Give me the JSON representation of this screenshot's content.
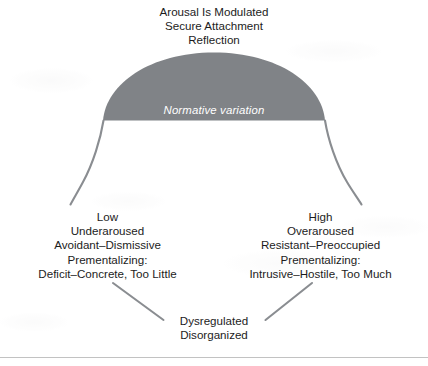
{
  "figure": {
    "title_block": {
      "lines": [
        "Arousal Is Modulated",
        "Secure Attachment",
        "Reflection"
      ]
    },
    "arch": {
      "caption": "Normative variation",
      "fill_color": "#808387",
      "stroke_color": "#8a8d91",
      "caption_color": "#ffffff"
    },
    "left_branch": {
      "lines": [
        "Low",
        "Underaroused",
        "Avoidant–Dismissive",
        "Prementalizing:",
        "Deficit–Concrete, Too Little"
      ]
    },
    "right_branch": {
      "lines": [
        "High",
        "Overaroused",
        "Resistant–Preoccupied",
        "Prementalizing:",
        "Intrusive–Hostile, Too Much"
      ]
    },
    "bottom_branch": {
      "lines": [
        "Dysregulated",
        "Disorganized"
      ]
    },
    "connectors": {
      "left_diagonal_color": "#8a8d91",
      "right_diagonal_color": "#8a8d91"
    },
    "rule_color": "#c2c2c2",
    "text_color": "#1c1c1c",
    "background_color": "#ffffff"
  }
}
